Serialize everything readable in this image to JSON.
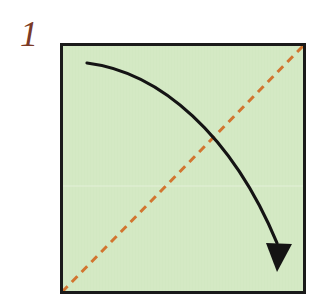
{
  "figure": {
    "kind": "origami-instruction-diagram",
    "title": "",
    "canvas": {
      "width": 329,
      "height": 304,
      "background": "#ffffff"
    }
  },
  "step": {
    "number": "1",
    "label_color": "#7b3a27"
  },
  "paper": {
    "name": "square-sheet",
    "fill": "#d4e9c4",
    "border_color": "#1a1a1a",
    "border_width": 3,
    "x": 60,
    "y": 43,
    "width": 246,
    "height": 251
  },
  "crease": {
    "name": "valley-fold-diagonal",
    "style": "dashed",
    "color": "#d2752f",
    "stroke_width": 3,
    "dash": "8 6",
    "from": {
      "x": 62,
      "y": 292
    },
    "to": {
      "x": 304,
      "y": 45
    },
    "description": "diagonal fold line from bottom-left corner to top-right corner"
  },
  "horizontal_crease": {
    "name": "faint-horizontal-line",
    "color": "#e3f0d8",
    "stroke_width": 1,
    "y": 186
  },
  "arrow": {
    "name": "fold-direction-arrow",
    "color": "#141414",
    "stroke_width": 3.2,
    "path": "M 87 63 C 160 72, 232 135, 277 243",
    "head": {
      "points": "277,272 266,243 292,244",
      "color": "#141414"
    },
    "description": "curved arrow showing top-left corner folding down to bottom-right corner"
  },
  "icons": {
    "arrowhead": "arrowhead-triangle-icon",
    "dashed_line": "dashed-crease-icon"
  }
}
